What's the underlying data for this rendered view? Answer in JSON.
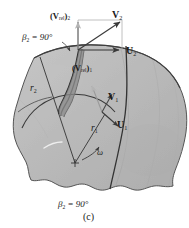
{
  "figure": {
    "caption": "(c)",
    "blade_angle_top": "β₂ = 90°",
    "blade_angle_bottom": "β₂ = 90°",
    "labels": {
      "v_rel_2": "(Vrel)₂",
      "v_2": "V₂",
      "u_2": "U₂",
      "v_rel_1": "(Vrel)₁",
      "v_1": "V₁",
      "u_1": "U₁",
      "r_1": "r₁",
      "r_2": "r₂",
      "omega": "ω"
    },
    "label_parts": {
      "v_rel_2": {
        "open": "(",
        "bold": "V",
        "sub_inner": "rel",
        "close": ")",
        "sub_outer": "2"
      },
      "v_rel_1": {
        "open": "(",
        "bold": "V",
        "sub_inner": "rel",
        "close": ")",
        "sub_outer": "1"
      },
      "v_2": {
        "bold": "V",
        "sub": "2"
      },
      "u_2": {
        "bold": "U",
        "sub": "2"
      },
      "v_1": {
        "bold": "V",
        "sub": "1"
      },
      "u_1": {
        "bold": "U",
        "sub": "1"
      },
      "r_1": {
        "italic": "r",
        "sub": "1"
      },
      "r_2": {
        "italic": "r",
        "sub": "2"
      },
      "beta_top": {
        "italic": "β",
        "sub": "2",
        "rest": " = 90°"
      },
      "beta_bottom": {
        "italic": "β",
        "sub": "2",
        "rest": " = 90°"
      },
      "omega": {
        "italic": "ω"
      }
    },
    "colors": {
      "impeller_fill": "#b9b9b9",
      "impeller_edge": "#4a4a4a",
      "blade_dark": "#2e2e2e",
      "vector_stroke": "#3a3a3a",
      "vector_light": "#cfcfcf",
      "text": "#1a1a1a",
      "highlight": "#e8e8e8",
      "shadow": "#9a9a9a"
    },
    "geometry": {
      "center_x": 75,
      "center_y": 163,
      "triangle_corner_x": 78,
      "triangle_corner_y": 50,
      "triangle_top_y": 20,
      "triangle_right_x": 122
    }
  }
}
